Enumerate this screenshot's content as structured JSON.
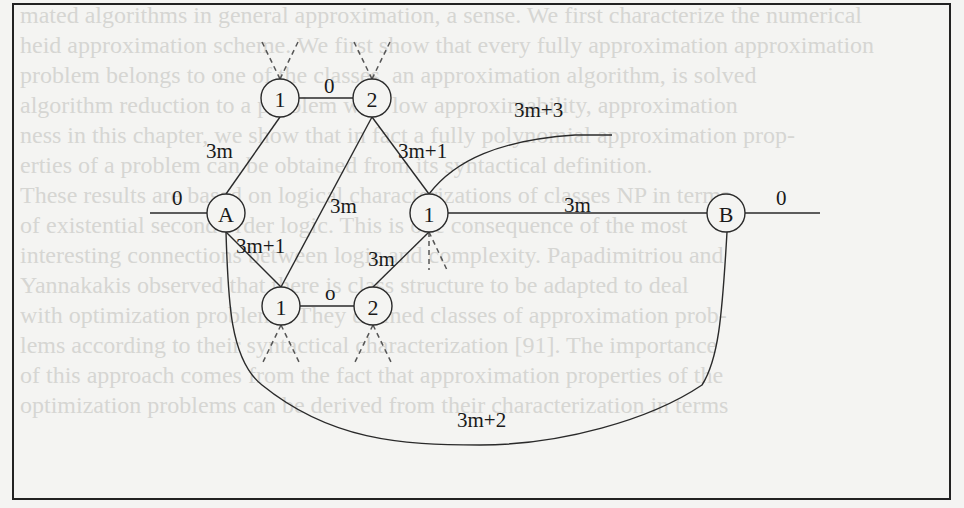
{
  "figure": {
    "type": "gadget-graph",
    "nodes": [
      {
        "id": "top1",
        "label": "1",
        "x": 280,
        "y": 98
      },
      {
        "id": "top2",
        "label": "2",
        "x": 372,
        "y": 98
      },
      {
        "id": "A",
        "label": "A",
        "x": 226,
        "y": 213
      },
      {
        "id": "mid1",
        "label": "1",
        "x": 429,
        "y": 213
      },
      {
        "id": "B",
        "label": "B",
        "x": 726,
        "y": 213
      },
      {
        "id": "bot1",
        "label": "1",
        "x": 281,
        "y": 306
      },
      {
        "id": "bot2",
        "label": "2",
        "x": 373,
        "y": 306
      }
    ],
    "edge_labels": {
      "top_0": "0",
      "a_top1": "3m",
      "top2_mid1": "3m+1",
      "mid1_out": "3m+3",
      "a_left": "0",
      "bot1_top2": "3m",
      "mid1_b": "3m",
      "b_right": "0",
      "a_bot1": "3m+1",
      "bot2_mid1": "3m",
      "bot_o": "o",
      "a_b_curve": "3m+2"
    }
  },
  "bleed_text": [
    "mated algorithms in general approximation, a sense. We first characterize the numerical",
    "heid approximation scheme. We first show that every fully approximation approximation",
    "problem belongs to one of the classes, an approximation algorithm, is solved",
    "algorithm reduction to a problem with low approximability, approximation",
    "ness in this chapter, we show that in fact a fully polynomial approximation prop-",
    "erties of a problem can be obtained from its syntactical definition.",
    "These results are based on logical characterizations of classes NP in terms",
    "of existential second order logic. This is one consequence of the most",
    "interesting connections between logic and complexity. Papadimitriou and",
    "Yannakakis observed that there is class structure to be adapted to deal",
    "with optimization problems. They defined classes of approximation prob-",
    "lems according to their syntactical characterization [91]. The importance",
    "of this approach comes from the fact that approximation properties of the",
    "optimization problems can be derived from their characterization in terms"
  ]
}
